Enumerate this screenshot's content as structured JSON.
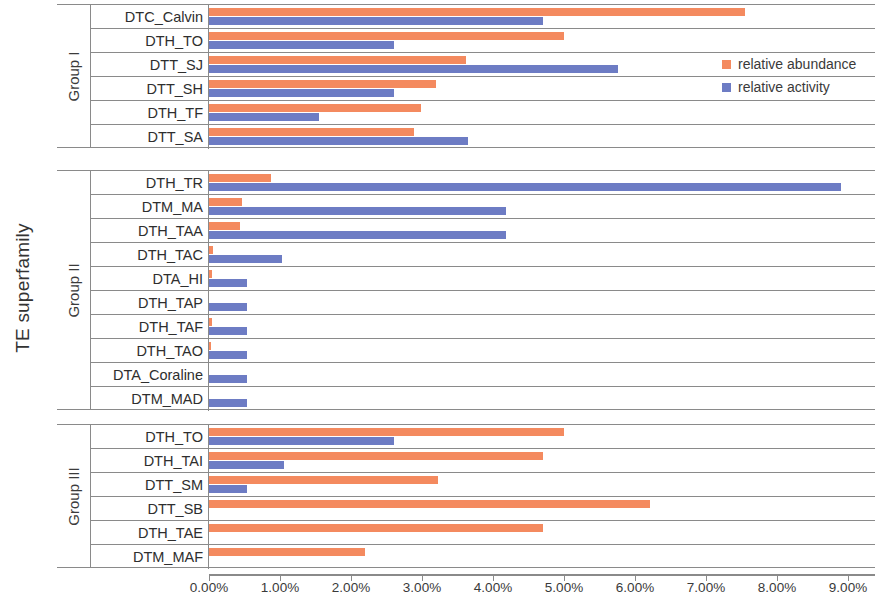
{
  "chart_data": {
    "type": "bar",
    "orientation": "horizontal",
    "title": "",
    "xlabel": "",
    "ylabel": "TE superfamily",
    "xlim": [
      0,
      9.0
    ],
    "x_tick_labels": [
      "0.00%",
      "1.00%",
      "2.00%",
      "3.00%",
      "4.00%",
      "5.00%",
      "6.00%",
      "7.00%",
      "8.00%",
      "9.00%"
    ],
    "x_ticks": [
      0,
      1,
      2,
      3,
      4,
      5,
      6,
      7,
      8,
      9
    ],
    "grid": false,
    "legend_position": "top-right",
    "series": [
      {
        "name": "relative abundance",
        "color": "#F48A5F"
      },
      {
        "name": "relative activity",
        "color": "#6D7CC4"
      }
    ],
    "groups": [
      {
        "name": "Group I",
        "categories": [
          "DTC_Calvin",
          "DTH_TO",
          "DTT_SJ",
          "DTT_SH",
          "DTH_TF",
          "DTT_SA"
        ],
        "relative_abundance": [
          7.55,
          5.0,
          3.62,
          3.2,
          2.98,
          2.89
        ],
        "relative_activity": [
          4.7,
          2.6,
          5.76,
          2.6,
          1.55,
          3.65
        ]
      },
      {
        "name": "Group II",
        "categories": [
          "DTH_TR",
          "DTM_MA",
          "DTH_TAA",
          "DTH_TAC",
          "DTA_HI",
          "DTH_TAP",
          "DTH_TAF",
          "DTH_TAO",
          "DTA_Coraline",
          "DTM_MAD"
        ],
        "relative_abundance": [
          0.88,
          0.46,
          0.43,
          0.05,
          0.04,
          0.0,
          0.04,
          0.03,
          0.0,
          0.0
        ],
        "relative_activity": [
          8.9,
          4.18,
          4.18,
          1.03,
          0.53,
          0.53,
          0.53,
          0.53,
          0.53,
          0.53
        ]
      },
      {
        "name": "Group III",
        "categories": [
          "DTH_TO",
          "DTH_TAI",
          "DTT_SM",
          "DTT_SB",
          "DTH_TAE",
          "DTM_MAF"
        ],
        "relative_abundance": [
          5.0,
          4.7,
          3.23,
          6.21,
          4.7,
          2.2
        ],
        "relative_activity": [
          2.6,
          1.06,
          0.53,
          0.0,
          0.0,
          0.0
        ]
      }
    ]
  },
  "axis": {
    "y_title": "TE superfamily"
  },
  "legend": {
    "items": [
      {
        "label": "relative abundance",
        "color": "#F48A5F"
      },
      {
        "label": "relative activity",
        "color": "#6D7CC4"
      }
    ]
  }
}
